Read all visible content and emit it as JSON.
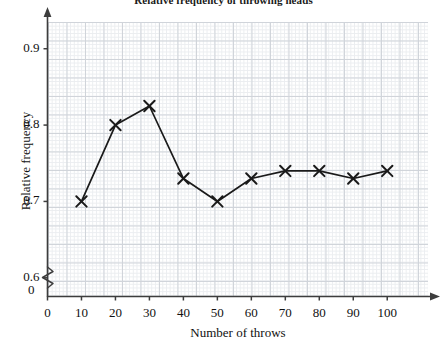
{
  "chart_data": {
    "type": "line",
    "title": "Relative frequency of throwing heads",
    "xlabel": "Number of throws",
    "ylabel": "Relative frequency",
    "x": [
      10,
      20,
      30,
      40,
      50,
      60,
      70,
      80,
      90,
      100
    ],
    "values": [
      0.7,
      0.8,
      0.825,
      0.73,
      0.7,
      0.73,
      0.74,
      0.74,
      0.73,
      0.74
    ],
    "series": [
      {
        "name": "Relative frequency",
        "values": [
          0.7,
          0.8,
          0.825,
          0.73,
          0.7,
          0.73,
          0.74,
          0.74,
          0.73,
          0.74
        ]
      }
    ],
    "xlim": [
      0,
      112
    ],
    "ylim": [
      0.5755,
      0.935
    ],
    "xticks": [
      0,
      10,
      20,
      30,
      40,
      50,
      60,
      70,
      80,
      90,
      100
    ],
    "xtick_labels": [
      "0",
      "10",
      "20",
      "30",
      "40",
      "50",
      "60",
      "70",
      "80",
      "90",
      "100"
    ],
    "yticks": [
      0.6,
      0.7,
      0.8,
      0.9
    ],
    "ytick_labels": [
      "0.6",
      "0.7",
      "0.8",
      "0.9"
    ],
    "origin_label": "0",
    "grid": true,
    "grid_style": "graph-paper",
    "legend": false,
    "marker": "x-cross",
    "axis_break": {
      "axis": "y",
      "symbol": "zigzag",
      "position_value": 0.588
    },
    "colors": {
      "line": "#1a1a1a",
      "marker": "#1a1a1a",
      "axis": "#3d3d3d",
      "grid_major": "#c8cdd4",
      "grid_minor": "#e8ebee",
      "background": "#ffffff",
      "text": "#111111"
    }
  }
}
